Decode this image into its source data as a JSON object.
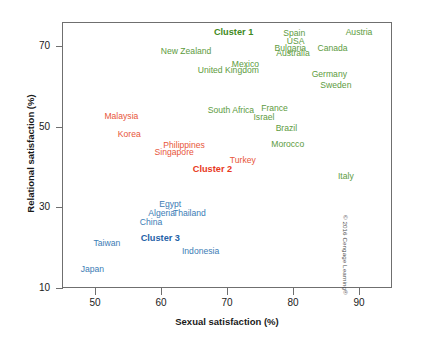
{
  "chart_data": {
    "type": "scatter",
    "title": "",
    "xlabel": "Sexual satisfaction (%)",
    "ylabel": "Relational satisfaction (%)",
    "xlim": [
      45,
      95
    ],
    "ylim": [
      10,
      76
    ],
    "xticks": [
      50,
      60,
      70,
      80,
      90
    ],
    "yticks": [
      70,
      50,
      30,
      10
    ],
    "grid": false,
    "legend": "none",
    "colors": {
      "cluster1": "#5d9b3e",
      "cluster2": "#e8563a",
      "cluster3": "#3b7cb5",
      "cluster1_label": "#3f8a22",
      "cluster2_label": "#e8391c",
      "cluster3_label": "#1f62a8",
      "frame": "#6f6f6f",
      "text": "#1a1a1a"
    },
    "series": [
      {
        "name": "Cluster 1",
        "color": "#5d9b3e",
        "points": [
          {
            "label": "Spain",
            "x": 80.2,
            "y": 73.2
          },
          {
            "label": "Austria",
            "x": 90.0,
            "y": 73.6
          },
          {
            "label": "USA",
            "x": 80.4,
            "y": 71.3
          },
          {
            "label": "Bulgaria",
            "x": 79.6,
            "y": 69.6
          },
          {
            "label": "Canada",
            "x": 86.0,
            "y": 69.5
          },
          {
            "label": "Australia",
            "x": 80.0,
            "y": 68.2
          },
          {
            "label": "New Zealand",
            "x": 63.8,
            "y": 68.9
          },
          {
            "label": "Mexico",
            "x": 72.8,
            "y": 65.5
          },
          {
            "label": "United Kingdom",
            "x": 70.2,
            "y": 64.0
          },
          {
            "label": "Germany",
            "x": 85.5,
            "y": 63.2
          },
          {
            "label": "Sweden",
            "x": 86.5,
            "y": 60.4
          },
          {
            "label": "South Africa",
            "x": 70.6,
            "y": 54.2
          },
          {
            "label": "France",
            "x": 77.2,
            "y": 54.6
          },
          {
            "label": "Israel",
            "x": 75.6,
            "y": 52.4
          },
          {
            "label": "Brazil",
            "x": 79.0,
            "y": 49.6
          },
          {
            "label": "Morocco",
            "x": 79.2,
            "y": 45.7
          },
          {
            "label": "Italy",
            "x": 88.0,
            "y": 37.9
          }
        ]
      },
      {
        "name": "Cluster 2",
        "color": "#e8563a",
        "points": [
          {
            "label": "Malaysia",
            "x": 54.0,
            "y": 52.6
          },
          {
            "label": "Korea",
            "x": 55.2,
            "y": 48.3
          },
          {
            "label": "Philippines",
            "x": 63.5,
            "y": 45.5
          },
          {
            "label": "Singapore",
            "x": 62.0,
            "y": 43.7
          },
          {
            "label": "Turkey",
            "x": 72.4,
            "y": 41.8
          }
        ]
      },
      {
        "name": "Cluster 3",
        "color": "#3b7cb5",
        "points": [
          {
            "label": "Egypt",
            "x": 61.4,
            "y": 30.8
          },
          {
            "label": "Algeria",
            "x": 60.1,
            "y": 28.6
          },
          {
            "label": "Thailand",
            "x": 64.3,
            "y": 28.6
          },
          {
            "label": "China",
            "x": 58.5,
            "y": 26.5
          },
          {
            "label": "Taiwan",
            "x": 51.8,
            "y": 21.2
          },
          {
            "label": "Indonesia",
            "x": 66.0,
            "y": 19.2
          },
          {
            "label": "Japan",
            "x": 49.6,
            "y": 14.6
          }
        ]
      }
    ],
    "annotations": [
      {
        "label": "Cluster 1",
        "x": 71.0,
        "y": 73.3,
        "color": "#3f8a22"
      },
      {
        "label": "Cluster 2",
        "x": 67.8,
        "y": 39.2,
        "color": "#e8391c"
      },
      {
        "label": "Cluster 3",
        "x": 59.9,
        "y": 22.1,
        "color": "#1f62a8"
      }
    ]
  },
  "credit": "© 2016 Cengage Learning®"
}
